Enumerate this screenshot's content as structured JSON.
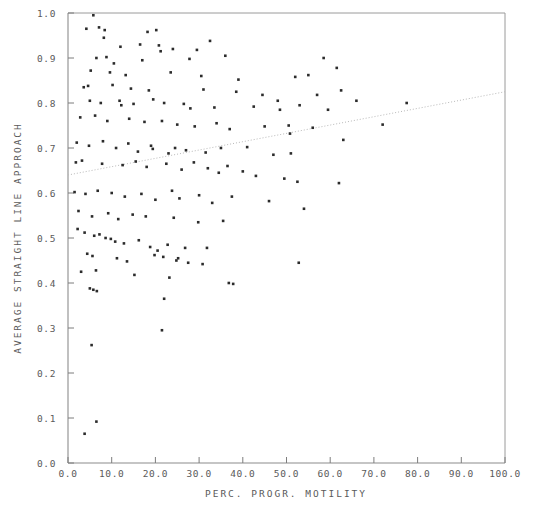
{
  "chart_data": {
    "type": "scatter",
    "title": "",
    "xlabel": "PERC. PROGR. MOTILITY",
    "ylabel": "AVERAGE STRAIGHT LINE APPROACH",
    "xlim": [
      0.0,
      100.0
    ],
    "ylim": [
      0.0,
      1.0
    ],
    "grid": false,
    "legend": "none",
    "xticks": [
      "0.0",
      "10.0",
      "20.0",
      "30.0",
      "40.0",
      "50.0",
      "60.0",
      "70.0",
      "80.0",
      "90.0",
      "100.0"
    ],
    "xtick_values": [
      0,
      10,
      20,
      30,
      40,
      50,
      60,
      70,
      80,
      90,
      100
    ],
    "yticks": [
      "0.0",
      "0.1",
      "0.2",
      "0.3",
      "0.4",
      "0.5",
      "0.6",
      "0.7",
      "0.8",
      "0.9",
      "1.0"
    ],
    "ytick_values": [
      0.0,
      0.1,
      0.2,
      0.3,
      0.4,
      0.5,
      0.6,
      0.7,
      0.8,
      0.9,
      1.0
    ],
    "marker": "square",
    "marker_color": "#2b2b2b",
    "marker_size": 2.6,
    "trend_line": {
      "style": "dotted",
      "color": "#b9b9b9",
      "x": [
        0.0,
        100.0
      ],
      "y": [
        0.64,
        0.825
      ]
    },
    "points": [
      [
        5.8,
        0.995
      ],
      [
        4.2,
        0.965
      ],
      [
        7.1,
        0.968
      ],
      [
        8.4,
        0.962
      ],
      [
        8.2,
        0.945
      ],
      [
        18.2,
        0.958
      ],
      [
        20.2,
        0.962
      ],
      [
        32.5,
        0.938
      ],
      [
        12.0,
        0.925
      ],
      [
        16.5,
        0.93
      ],
      [
        20.8,
        0.928
      ],
      [
        21.2,
        0.915
      ],
      [
        24.0,
        0.92
      ],
      [
        29.5,
        0.918
      ],
      [
        6.5,
        0.9
      ],
      [
        8.8,
        0.902
      ],
      [
        10.5,
        0.888
      ],
      [
        17.0,
        0.895
      ],
      [
        27.8,
        0.898
      ],
      [
        36.0,
        0.905
      ],
      [
        58.5,
        0.9
      ],
      [
        61.5,
        0.878
      ],
      [
        5.2,
        0.872
      ],
      [
        9.6,
        0.868
      ],
      [
        13.2,
        0.862
      ],
      [
        23.5,
        0.868
      ],
      [
        30.5,
        0.86
      ],
      [
        39.0,
        0.852
      ],
      [
        52.0,
        0.858
      ],
      [
        55.0,
        0.862
      ],
      [
        3.6,
        0.835
      ],
      [
        4.6,
        0.838
      ],
      [
        10.2,
        0.84
      ],
      [
        14.4,
        0.832
      ],
      [
        18.5,
        0.828
      ],
      [
        31.0,
        0.83
      ],
      [
        38.5,
        0.825
      ],
      [
        44.5,
        0.818
      ],
      [
        57.0,
        0.818
      ],
      [
        62.5,
        0.828
      ],
      [
        66.0,
        0.805
      ],
      [
        77.5,
        0.8
      ],
      [
        5.0,
        0.805
      ],
      [
        7.5,
        0.8
      ],
      [
        11.8,
        0.805
      ],
      [
        12.2,
        0.795
      ],
      [
        15.0,
        0.798
      ],
      [
        19.5,
        0.808
      ],
      [
        22.0,
        0.8
      ],
      [
        26.5,
        0.798
      ],
      [
        28.0,
        0.788
      ],
      [
        33.5,
        0.79
      ],
      [
        42.5,
        0.792
      ],
      [
        48.0,
        0.805
      ],
      [
        48.5,
        0.785
      ],
      [
        53.0,
        0.795
      ],
      [
        59.5,
        0.785
      ],
      [
        72.0,
        0.752
      ],
      [
        2.8,
        0.768
      ],
      [
        6.2,
        0.772
      ],
      [
        9.0,
        0.76
      ],
      [
        14.0,
        0.765
      ],
      [
        17.5,
        0.758
      ],
      [
        21.5,
        0.76
      ],
      [
        25.0,
        0.752
      ],
      [
        29.0,
        0.748
      ],
      [
        34.0,
        0.755
      ],
      [
        37.0,
        0.742
      ],
      [
        45.0,
        0.748
      ],
      [
        50.5,
        0.75
      ],
      [
        50.8,
        0.732
      ],
      [
        56.0,
        0.745
      ],
      [
        63.0,
        0.718
      ],
      [
        2.0,
        0.712
      ],
      [
        4.8,
        0.705
      ],
      [
        8.0,
        0.715
      ],
      [
        11.0,
        0.7
      ],
      [
        13.8,
        0.71
      ],
      [
        16.0,
        0.692
      ],
      [
        19.0,
        0.705
      ],
      [
        19.4,
        0.698
      ],
      [
        23.0,
        0.688
      ],
      [
        24.5,
        0.7
      ],
      [
        27.0,
        0.695
      ],
      [
        31.5,
        0.69
      ],
      [
        35.0,
        0.7
      ],
      [
        41.0,
        0.702
      ],
      [
        47.0,
        0.685
      ],
      [
        51.0,
        0.688
      ],
      [
        1.8,
        0.668
      ],
      [
        3.2,
        0.672
      ],
      [
        7.8,
        0.665
      ],
      [
        12.5,
        0.662
      ],
      [
        15.5,
        0.67
      ],
      [
        18.0,
        0.658
      ],
      [
        22.5,
        0.665
      ],
      [
        26.0,
        0.652
      ],
      [
        28.8,
        0.668
      ],
      [
        32.0,
        0.655
      ],
      [
        34.5,
        0.645
      ],
      [
        36.5,
        0.66
      ],
      [
        40.0,
        0.648
      ],
      [
        43.0,
        0.638
      ],
      [
        49.5,
        0.632
      ],
      [
        52.5,
        0.625
      ],
      [
        62.0,
        0.622
      ],
      [
        1.5,
        0.602
      ],
      [
        4.0,
        0.598
      ],
      [
        6.8,
        0.605
      ],
      [
        10.0,
        0.6
      ],
      [
        13.0,
        0.592
      ],
      [
        16.8,
        0.598
      ],
      [
        20.0,
        0.585
      ],
      [
        23.8,
        0.605
      ],
      [
        25.5,
        0.588
      ],
      [
        30.0,
        0.595
      ],
      [
        33.0,
        0.578
      ],
      [
        37.5,
        0.592
      ],
      [
        46.0,
        0.582
      ],
      [
        54.0,
        0.565
      ],
      [
        2.4,
        0.56
      ],
      [
        5.5,
        0.548
      ],
      [
        9.2,
        0.555
      ],
      [
        11.5,
        0.542
      ],
      [
        14.8,
        0.552
      ],
      [
        17.8,
        0.548
      ],
      [
        24.2,
        0.545
      ],
      [
        29.8,
        0.535
      ],
      [
        35.5,
        0.538
      ],
      [
        2.2,
        0.52
      ],
      [
        3.8,
        0.512
      ],
      [
        6.0,
        0.505
      ],
      [
        7.2,
        0.508
      ],
      [
        8.6,
        0.5
      ],
      [
        9.8,
        0.498
      ],
      [
        10.8,
        0.492
      ],
      [
        12.8,
        0.488
      ],
      [
        16.2,
        0.495
      ],
      [
        18.8,
        0.48
      ],
      [
        20.5,
        0.472
      ],
      [
        22.8,
        0.485
      ],
      [
        26.8,
        0.478
      ],
      [
        31.8,
        0.478
      ],
      [
        4.4,
        0.465
      ],
      [
        5.6,
        0.46
      ],
      [
        11.2,
        0.455
      ],
      [
        13.5,
        0.448
      ],
      [
        19.8,
        0.462
      ],
      [
        21.8,
        0.458
      ],
      [
        24.8,
        0.45
      ],
      [
        25.2,
        0.455
      ],
      [
        27.5,
        0.445
      ],
      [
        30.8,
        0.442
      ],
      [
        52.8,
        0.445
      ],
      [
        3.0,
        0.425
      ],
      [
        6.4,
        0.428
      ],
      [
        15.2,
        0.418
      ],
      [
        23.2,
        0.412
      ],
      [
        5.0,
        0.388
      ],
      [
        5.8,
        0.385
      ],
      [
        6.6,
        0.382
      ],
      [
        22.0,
        0.365
      ],
      [
        36.8,
        0.4
      ],
      [
        37.8,
        0.398
      ],
      [
        5.4,
        0.262
      ],
      [
        21.5,
        0.295
      ],
      [
        6.5,
        0.092
      ],
      [
        3.8,
        0.065
      ]
    ]
  }
}
